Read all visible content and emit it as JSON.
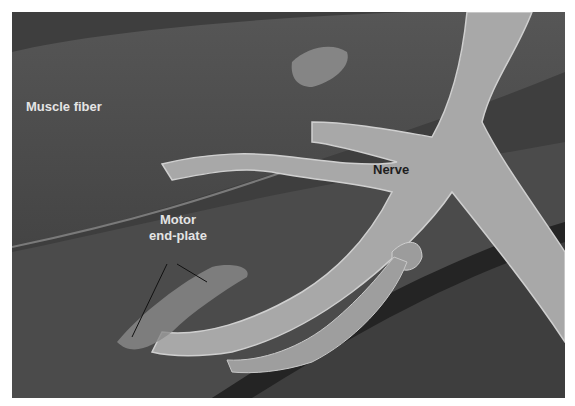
{
  "figure": {
    "labels": {
      "muscle_fiber": "Muscle fiber",
      "motor_line1": "Motor",
      "motor_line2": "end-plate",
      "nerve": "Nerve"
    },
    "colors": {
      "background": "#4a4a4a",
      "nerve": "#a9a9a9",
      "fiber": "#5a5a5a",
      "gap": "#262626"
    }
  }
}
